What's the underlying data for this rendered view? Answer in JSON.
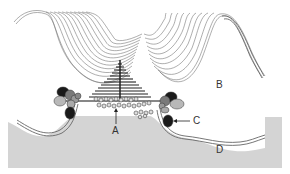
{
  "diagram": {
    "labels": {
      "A": "A",
      "B": "B",
      "C": "C",
      "D": "D"
    },
    "colors": {
      "background": "#ffffff",
      "region_d": "#d4d4d4",
      "membrane_line": "#555555",
      "fiber_line": "#777777",
      "stack_dark": "#222222",
      "protein_dark": "#1a1a1a",
      "protein_mid": "#7a7a7a",
      "protein_light": "#b8b8b8"
    }
  }
}
